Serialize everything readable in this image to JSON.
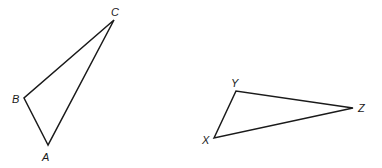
{
  "diagram": {
    "type": "two-triangles",
    "stroke_color": "#1a1a1a",
    "background": "#ffffff",
    "triangles": [
      {
        "name": "ABC",
        "vertices": [
          {
            "label": "A",
            "x": 48,
            "y": 145,
            "label_x": 42,
            "label_y": 161
          },
          {
            "label": "B",
            "x": 24,
            "y": 98,
            "label_x": 12,
            "label_y": 103
          },
          {
            "label": "C",
            "x": 114,
            "y": 20,
            "label_x": 111,
            "label_y": 16
          }
        ]
      },
      {
        "name": "XYZ",
        "vertices": [
          {
            "label": "X",
            "x": 214,
            "y": 138,
            "label_x": 202,
            "label_y": 144
          },
          {
            "label": "Y",
            "x": 236,
            "y": 91,
            "label_x": 231,
            "label_y": 87
          },
          {
            "label": "Z",
            "x": 353,
            "y": 108,
            "label_x": 358,
            "label_y": 112
          }
        ]
      }
    ]
  }
}
